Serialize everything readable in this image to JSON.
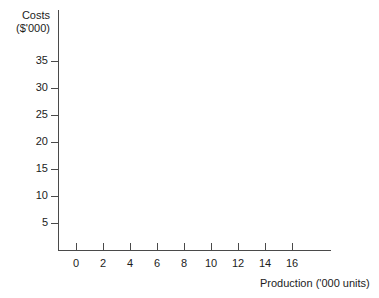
{
  "chart_data": {
    "type": "line",
    "title": "",
    "subtitle": "",
    "xlabel": "Production ('000 units)",
    "ylabel_line1": "Costs",
    "ylabel_line2": "($'000)",
    "ylabel": "Costs ($'000)",
    "x_ticks": [
      "0",
      "2",
      "4",
      "6",
      "8",
      "10",
      "12",
      "14",
      "16"
    ],
    "y_ticks": [
      "5",
      "10",
      "15",
      "20",
      "25",
      "30",
      "35"
    ],
    "xlim": [
      0,
      18
    ],
    "ylim": [
      0,
      40
    ],
    "x_tick_step": 2,
    "y_tick_step": 5,
    "grid": false,
    "legend": false,
    "legend_position": "none",
    "series": [],
    "annotations": [],
    "axis_color": "#4a4a4a",
    "text_color": "#1c1c1c",
    "background_color": "#ffffff"
  }
}
